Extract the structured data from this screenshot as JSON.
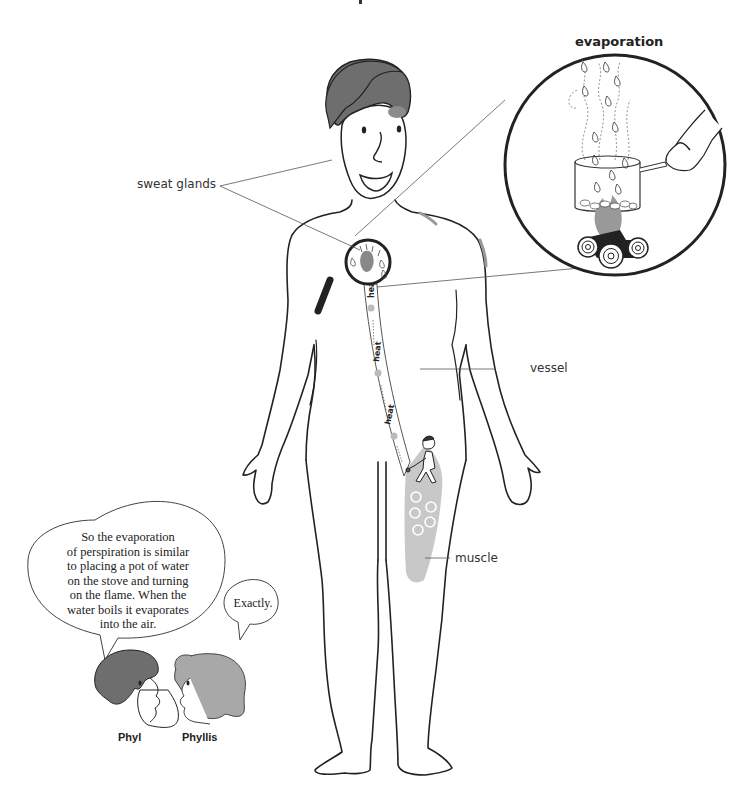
{
  "title_fragment": "",
  "labels": {
    "evaporation": "evaporation",
    "sweat_glands": "sweat glands",
    "vessel": "vessel",
    "muscle": "muscle",
    "heat": [
      "heat",
      "heat",
      "heat"
    ]
  },
  "dialogue": {
    "phyl": {
      "name": "Phyl",
      "speech": [
        "So the evaporation",
        "of perspiration is similar",
        "to placing a pot of water",
        "on the stove and turning",
        "on the flame. When the",
        "water boils it evaporates",
        "into the air."
      ]
    },
    "phyllis": {
      "name": "Phyllis",
      "speech": [
        "Exactly."
      ]
    }
  },
  "colors": {
    "outline": "#222222",
    "hair_dark": "#6e6e6e",
    "hair_light": "#a8a8a8",
    "muscle_fill": "#c8c8c8",
    "leader_line": "#555555"
  }
}
